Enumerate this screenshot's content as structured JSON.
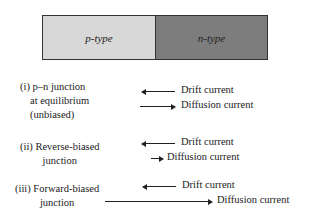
{
  "bar": {
    "p_label": "p-type",
    "n_label": "n-type",
    "p_color": "#d8d8d8",
    "n_color": "#7d7d7d"
  },
  "cases": [
    {
      "line1": "(i) p–n junction",
      "line2": "at equilibrium",
      "line3": "(unbiased)",
      "drift": "Drift current",
      "diffusion": "Diffusion current"
    },
    {
      "line1": "(ii) Reverse-biased",
      "line2": "junction",
      "drift": "Drift current",
      "diffusion": "Diffusion current"
    },
    {
      "line1": "(iii) Forward-biased",
      "line2": "junction",
      "drift": "Drift current",
      "diffusion": "Diffusion current"
    }
  ]
}
